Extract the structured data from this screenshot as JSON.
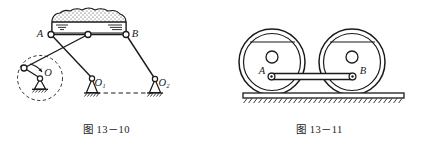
{
  "page": {
    "background_color": "#ffffff",
    "ink_color": "#1a1a1a",
    "width": 426,
    "height": 150
  },
  "figures": [
    {
      "id": "fig-13-10",
      "caption": "图 13－10",
      "description": "四杆机构带料斗（振动/翻转输送机构）",
      "labels": {
        "joint_a": "A",
        "joint_b": "B",
        "pivot_o": "O",
        "pivot_o1": "O₁",
        "pivot_o2": "O₂"
      }
    },
    {
      "id": "fig-13-11",
      "caption": "图 13－11",
      "description": "机车双轮联动连杆机构（车轮与连杆置于轨道上）",
      "labels": {
        "pin_a": "A",
        "pin_b": "B"
      }
    }
  ]
}
